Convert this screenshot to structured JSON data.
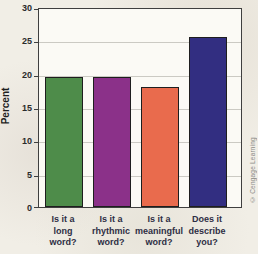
{
  "chart_data": {
    "type": "bar",
    "title": "",
    "categories": [
      "Is it a\nlong\nword?",
      "Is it a\nrhythmic\nword?",
      "Is it a\nmeaningful\nword?",
      "Does it\ndescribe\nyou?"
    ],
    "values": [
      19.5,
      19.5,
      18,
      25.5
    ],
    "bar_colors": [
      "#4e8c4a",
      "#8b3189",
      "#e96b4d",
      "#322e81"
    ],
    "xlabel": "",
    "ylabel": "Percent",
    "ylim": [
      0,
      30
    ],
    "yticks": [
      0,
      5,
      10,
      15,
      20,
      25,
      30
    ],
    "grid": true,
    "legend": "none"
  },
  "credit": "© Cengage Learning",
  "colors": {
    "grid": "#cbcac3",
    "axis": "#3f3f3f",
    "plot_bg": "#fbfaf5",
    "page_bg": "#f1eee6",
    "label_text": "#2e2e44",
    "tick_text": "#2b2b2b",
    "credit_text": "#8b8b86"
  }
}
